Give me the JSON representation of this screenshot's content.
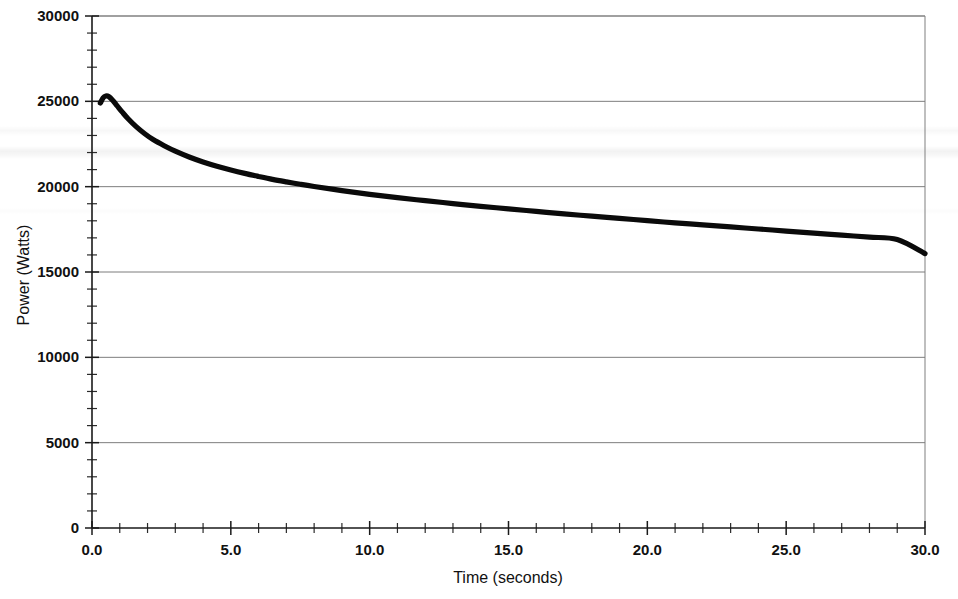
{
  "chart_data": {
    "type": "line",
    "title": "",
    "xlabel": "Time (seconds)",
    "ylabel": "Power (Watts)",
    "xlim": [
      0.0,
      30.0
    ],
    "ylim": [
      0,
      30000
    ],
    "grid": true,
    "legend": null,
    "x_tick_labels": [
      "0.0",
      "5.0",
      "10.0",
      "15.0",
      "20.0",
      "25.0",
      "30.0"
    ],
    "x_ticks": [
      0.0,
      5.0,
      10.0,
      15.0,
      20.0,
      25.0,
      30.0
    ],
    "x_minor_tick_interval": 1.0,
    "y_tick_labels": [
      "0",
      "5000",
      "10000",
      "15000",
      "20000",
      "25000",
      "30000"
    ],
    "y_ticks": [
      0,
      5000,
      10000,
      15000,
      20000,
      25000,
      30000
    ],
    "y_minor_tick_interval": 1000,
    "series": [
      {
        "name": "Power",
        "color": "#0a0a0a",
        "x": [
          0.3,
          0.4,
          0.5,
          0.6,
          0.75,
          0.9,
          1.1,
          1.3,
          1.6,
          1.9,
          2.2,
          2.6,
          3.0,
          3.5,
          4.0,
          4.5,
          5.0,
          5.5,
          6.0,
          6.5,
          7.0,
          7.5,
          8.0,
          9.0,
          10.0,
          11.0,
          12.0,
          13.0,
          14.0,
          15.0,
          16.0,
          17.0,
          18.0,
          19.0,
          20.0,
          21.0,
          22.0,
          23.0,
          24.0,
          25.0,
          26.0,
          27.0,
          28.0,
          29.0,
          30.0
        ],
        "y": [
          24900,
          25200,
          25310,
          25280,
          25050,
          24750,
          24350,
          23980,
          23500,
          23100,
          22760,
          22400,
          22080,
          21740,
          21450,
          21200,
          20980,
          20780,
          20600,
          20430,
          20280,
          20140,
          20010,
          19770,
          19550,
          19360,
          19180,
          19010,
          18850,
          18700,
          18550,
          18410,
          18270,
          18140,
          18010,
          17880,
          17760,
          17640,
          17520,
          17400,
          17280,
          17160,
          17040,
          16900,
          16080
        ]
      }
    ],
    "annotations": {
      "peak_value": 25310,
      "peak_time": 0.5,
      "end_value": 16080,
      "end_time": 30.0
    }
  },
  "axes": {
    "y_title": "Power (Watts)",
    "x_title": "Time (seconds)"
  }
}
